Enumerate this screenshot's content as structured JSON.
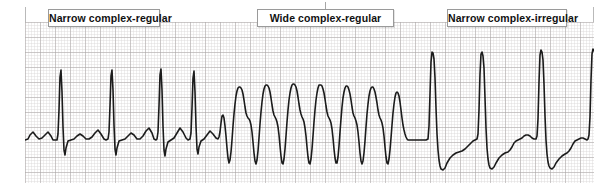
{
  "figure": {
    "name": "ecg-rhythm-strip-comparison"
  },
  "callouts": [
    {
      "id": "narrow-regular",
      "label": "Narrow complex-regular"
    },
    {
      "id": "wide-regular",
      "label": "Wide complex-regular"
    },
    {
      "id": "narrow-irregular",
      "label": "Narrow complex-irregular"
    }
  ],
  "paper": {
    "small_box_px": 3,
    "large_box_px": 15,
    "fine_grid_color": "#d6d2d2",
    "bold_grid_color": "#a9a4a4",
    "background_color": "#ffffff"
  },
  "trace": {
    "stroke_color": "#1b1b1b",
    "stroke_width": 1.6,
    "segments": [
      {
        "id": "narrow-regular",
        "label": "Narrow complex-regular",
        "x_start": 0,
        "x_end": 175,
        "baseline_y": 118,
        "beats": 5,
        "qrs_width_px": 4,
        "r_peak_y": 48,
        "s_trough_y": 133,
        "rhythm": "regular",
        "qrs_morphology": "narrow"
      },
      {
        "id": "wide-regular",
        "label": "Wide complex-regular",
        "x_start": 175,
        "x_end": 375,
        "baseline_y": 105,
        "beats": 7,
        "qrs_width_px": 22,
        "r_peak_y": 62,
        "s_trough_y": 140,
        "rhythm": "regular",
        "qrs_morphology": "wide"
      },
      {
        "id": "narrow-irregular",
        "label": "Narrow complex-irregular",
        "x_start": 375,
        "x_end": 569,
        "baseline_y": 120,
        "beats": 5,
        "qrs_width_px": 4,
        "r_peak_y": 30,
        "s_trough_y": 148,
        "rhythm": "irregular",
        "qrs_morphology": "narrow"
      }
    ],
    "path_d": "M 0,118 L 3,117 5,113 8,110 11,114 14,117 17,116 20,113 23,110 26,114 28,118 30,118 32,118 33,112 34,88 35,55 36,48 37,70 38,105 39,128 40,133 41,126 43,119 46,118 49,117 52,114 55,112 58,114 61,117 64,117 67,115 70,111 73,108 76,112 79,117 81,118 83,117 84,110 85,84 86,54 87,48 88,68 89,103 90,127 91,133 92,126 94,119 97,118 100,117 103,114 106,111 109,113 112,117 115,117 118,114 121,109 124,106 127,111 129,117 131,118 132,117 133,110 134,84 135,53 136,47 137,68 138,104 139,128 140,134 141,127 143,120 146,118 149,116 152,111 155,106 158,110 161,116 163,118 165,117 166,111 167,86 168,56 169,49 170,70 171,104 172,127 173,132 174,125 176,119 179,117 182,113 185,109 188,112 191,116 193,117 194,115 195,110 196,101 197,94 198,93 199,96 200,104 201,114 202,126 203,136 204,141 205,138 206,130 207,118 208,104 209,92 210,82 211,74 212,69 213,66 214,65 215,65 216,66 217,68 218,72 219,78 220,85 221,91 222,94 223,96 224,97 225,99 226,103 227,110 228,120 229,131 230,139 231,142 232,138 233,129 234,116 235,102 236,90 237,80 238,72 239,67 240,64 241,63 242,63 243,64 244,66 245,70 246,76 247,83 248,89 249,93 250,95 251,97 252,100 253,105 254,113 255,124 256,134 257,141 258,142 259,137 260,127 261,114 262,100 263,88 264,78 265,71 266,66 267,63 268,62 269,62 270,63 271,65 272,69 273,75 274,82 275,88 276,92 277,95 278,97 279,100 280,106 281,114 282,125 283,135 284,141 285,142 286,137 287,127 288,114 289,100 290,88 291,78 292,71 293,66 294,63 295,63 296,63 297,64 298,67 299,71 300,77 301,84 302,90 303,94 304,96 305,98 306,101 307,107 308,116 309,127 310,136 311,141 312,141 313,135 314,124 315,110 316,97 317,85 318,76 319,70 320,66 321,64 322,64 323,65 324,68 325,72 326,78 327,85 328,91 329,94 330,96 331,99 332,103 333,110 334,120 335,131 336,139 337,142 338,139 339,131 340,119 341,105 342,92 343,82 344,74 345,69 346,66 347,65 348,65 349,67 350,70 351,75 352,81 353,88 354,93 355,96 356,98 357,101 358,106 359,114 360,125 361,135 362,141 363,142 364,137 365,128 366,116 367,103 368,91 369,82 370,75 371,71 372,70 373,71 374,74 375,80 376,88 377,96 378,103 379,108 380,112 381,115 382,117 383,118 386,118 389,118 392,118 395,118 398,118 401,118 403,117 404,104 405,72 406,40 407,30 408,31 409,37 410,56 411,86 412,112 413,128 414,138 415,144 416,147 418,148 420,146 422,141 425,136 428,133 431,131 434,130 437,129 440,127 443,124 446,121 448,119 450,118 452,117 453,112 454,88 455,52 456,32 457,30 458,34 459,46 460,76 461,106 462,126 463,137 464,143 465,146 467,147 469,145 471,141 474,136 477,133 480,131 483,130 485,128 487,125 489,121 491,119 493,118 495,117 497,116 499,114 501,113 503,113 505,114 507,116 509,117 511,117 512,114 513,97 514,60 515,33 516,28 517,30 518,38 519,62 520,94 521,118 522,132 523,140 524,144 525,146 527,147 529,145 531,141 534,137 537,134 540,132 542,131 544,129 546,126 548,122 550,119 552,118 554,117 556,116 558,116 560,117 562,118 563,117 564,113 565,95 566,58 567,32 568,27 569,29"
  }
}
